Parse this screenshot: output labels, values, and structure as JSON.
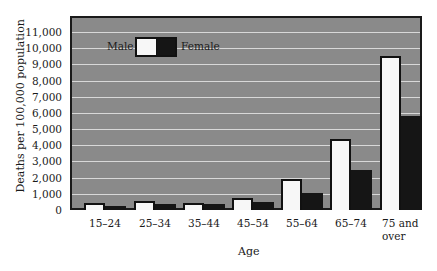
{
  "chart_data": {
    "type": "bar",
    "title": "",
    "xlabel": "Age",
    "ylabel": "Deaths per 100,000 population",
    "categories": [
      "15–24",
      "25–34",
      "35–44",
      "45–54",
      "55–64",
      "65–74",
      "75 and over"
    ],
    "series": [
      {
        "name": "Male",
        "color": "#f7f7f7",
        "values": [
          450,
          550,
          450,
          750,
          1900,
          4400,
          9500
        ]
      },
      {
        "name": "Female",
        "color": "#151515",
        "values": [
          250,
          350,
          350,
          500,
          1050,
          2450,
          5800
        ]
      }
    ],
    "ylim": [
      0,
      11000
    ],
    "yticks": [
      "0",
      "1,000",
      "2,000",
      "3,000",
      "4,000",
      "5,000",
      "6,000",
      "7,000",
      "8,000",
      "9,000",
      "10,000",
      "11,000"
    ],
    "grid": true,
    "legend_position": "top-left inside",
    "background_color": "#8a8a8a"
  },
  "legend": {
    "male": "Male",
    "female": "Female"
  },
  "axis": {
    "x_label": "Age",
    "y_label": "Deaths per 100,000 population"
  },
  "xticks": [
    {
      "line1": "15–24",
      "line2": ""
    },
    {
      "line1": "25–34",
      "line2": ""
    },
    {
      "line1": "35–44",
      "line2": ""
    },
    {
      "line1": "45–54",
      "line2": ""
    },
    {
      "line1": "55–64",
      "line2": ""
    },
    {
      "line1": "65–74",
      "line2": ""
    },
    {
      "line1": "75 and",
      "line2": "over"
    }
  ]
}
